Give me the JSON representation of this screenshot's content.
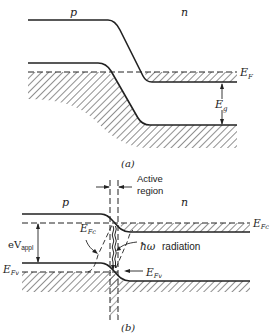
{
  "panel_a": {
    "caption": "(a)",
    "region_labels": {
      "p": "p",
      "n": "n"
    },
    "fermi_label": "E",
    "fermi_sub": "F",
    "gap_label": "E",
    "gap_sub": "g"
  },
  "panel_b": {
    "caption": "(b)",
    "region_labels": {
      "p": "p",
      "n": "n"
    },
    "active_region_line1": "Active",
    "active_region_line2": "region",
    "efc_label_right": "E",
    "efc_sub_right": "Fc",
    "efc_label_mid": "E",
    "efc_sub_mid": "Fc",
    "efv_label_left": "E",
    "efv_sub_left": "Fv",
    "efv_label_mid": "E",
    "efv_sub_mid": "Fv",
    "voltage_label": "eV",
    "voltage_sub": "appl",
    "radiation_symbol": "ħω",
    "radiation_label": "radiation"
  },
  "colors": {
    "ink": "#222222",
    "background": "#ffffff"
  }
}
